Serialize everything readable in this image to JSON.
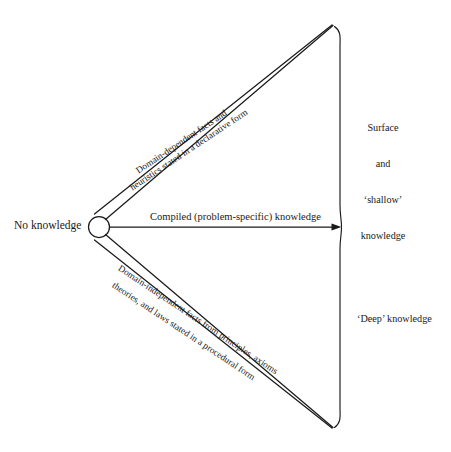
{
  "diagram": {
    "line_color": "#1a1a1a",
    "background_color": "#ffffff",
    "nodes": {
      "origin_label": "No knowledge"
    },
    "branches": {
      "upper": {
        "line1": "Domain-dependent facts and",
        "line2": "heuristics stated in a declarative form"
      },
      "middle": {
        "line1": "Compiled (problem-specific) knowledge"
      },
      "lower": {
        "line1": "Domain-independent facts from principles, axioms",
        "line2": "theories, and laws stated in a procedural form"
      }
    },
    "brace_labels": {
      "upper": {
        "line1": "Surface",
        "line2": "and",
        "line3": "‘shallow’",
        "line4": "knowledge"
      },
      "lower": {
        "line1": "‘Deep’ knowledge"
      }
    }
  }
}
